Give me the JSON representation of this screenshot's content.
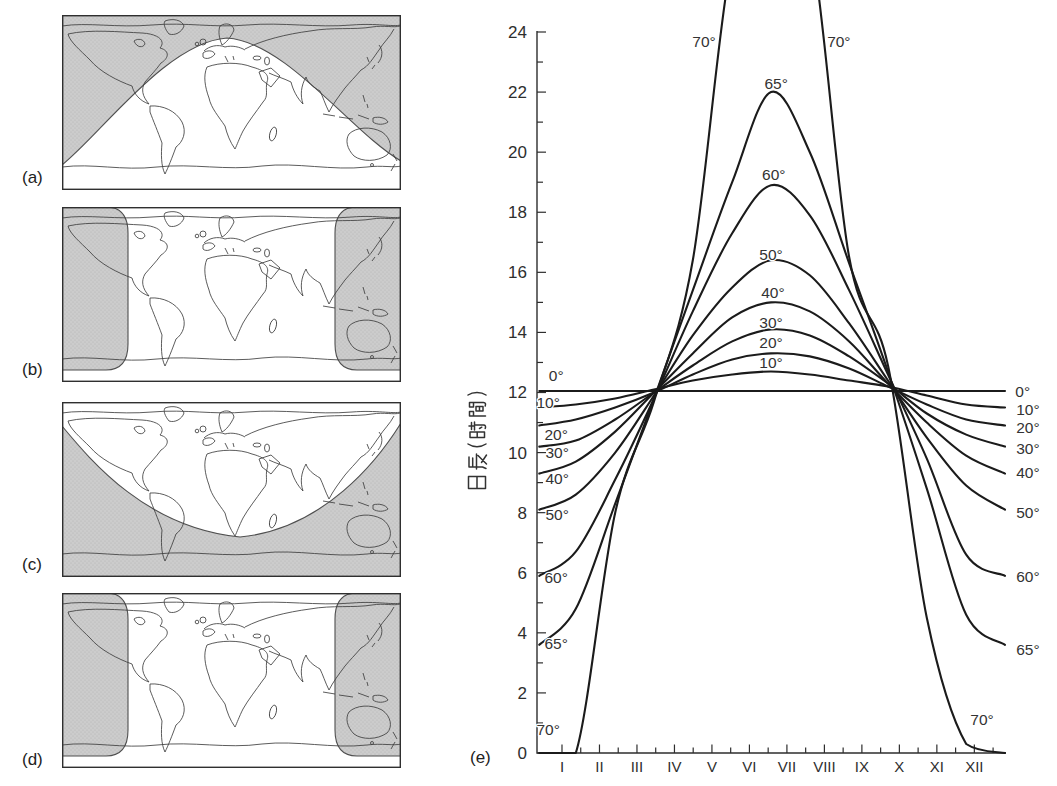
{
  "figure": {
    "panel_labels": {
      "a": "(a)",
      "b": "(b)",
      "c": "(c)",
      "d": "(d)",
      "e": "(e)"
    }
  },
  "chart_data": {
    "type": "line",
    "title": "",
    "xlabel": "",
    "ylabel": "日長（時間）",
    "ylim": [
      0,
      24
    ],
    "y_major_ticks": [
      0,
      2,
      4,
      6,
      8,
      10,
      12,
      14,
      16,
      18,
      20,
      22,
      24
    ],
    "y_minor_step": 1,
    "x_tick_labels": [
      "I",
      "II",
      "III",
      "IV",
      "V",
      "VI",
      "VII",
      "VIII",
      "IX",
      "X",
      "XI",
      "XII"
    ],
    "grid": false,
    "line_color": "#1b1b1b",
    "x_fracs": [
      0.005,
      0.083,
      0.167,
      0.25,
      0.333,
      0.417,
      0.5,
      0.583,
      0.667,
      0.75,
      0.833,
      0.917,
      1.0
    ],
    "series": [
      {
        "name": "0°",
        "latitude_deg": 0,
        "day_length_hours": [
          12.05,
          12.05,
          12.05,
          12.05,
          12.05,
          12.05,
          12.05,
          12.05,
          12.05,
          12.05,
          12.05,
          12.05,
          12.05
        ]
      },
      {
        "name": "10°",
        "latitude_deg": 10,
        "day_length_hours": [
          11.5,
          11.6,
          11.8,
          12.1,
          12.4,
          12.6,
          12.7,
          12.6,
          12.4,
          12.2,
          11.9,
          11.6,
          11.5
        ]
      },
      {
        "name": "20°",
        "latitude_deg": 20,
        "day_length_hours": [
          10.9,
          11.1,
          11.5,
          12.0,
          12.6,
          13.1,
          13.3,
          13.2,
          12.8,
          12.2,
          11.6,
          11.1,
          10.9
        ]
      },
      {
        "name": "30°",
        "latitude_deg": 30,
        "day_length_hours": [
          10.2,
          10.4,
          11.1,
          12.0,
          12.9,
          13.7,
          14.1,
          13.9,
          13.2,
          12.3,
          11.3,
          10.6,
          10.2
        ]
      },
      {
        "name": "40°",
        "latitude_deg": 40,
        "day_length_hours": [
          9.3,
          9.7,
          10.7,
          12.0,
          13.3,
          14.5,
          15.0,
          14.7,
          13.7,
          12.3,
          11.0,
          9.9,
          9.3
        ]
      },
      {
        "name": "50°",
        "latitude_deg": 50,
        "day_length_hours": [
          8.1,
          8.6,
          10.0,
          11.9,
          13.9,
          15.5,
          16.4,
          15.9,
          14.3,
          12.4,
          10.5,
          8.9,
          8.1
        ]
      },
      {
        "name": "60°",
        "latitude_deg": 60,
        "day_length_hours": [
          5.9,
          6.7,
          9.1,
          11.8,
          14.7,
          17.3,
          18.9,
          17.9,
          15.4,
          12.6,
          9.8,
          6.6,
          5.9
        ]
      },
      {
        "name": "65°",
        "latitude_deg": 65,
        "day_length_hours": [
          3.6,
          4.8,
          8.3,
          11.8,
          15.4,
          19.0,
          22.0,
          20.0,
          16.3,
          12.7,
          8.8,
          4.6,
          3.6
        ]
      },
      {
        "name": "70°",
        "latitude_deg": 70,
        "day_length_hours": [
          0,
          0,
          8.0,
          11.7,
          16.4,
          26.5,
          28.5,
          27.2,
          16.5,
          12.9,
          4.5,
          0.3,
          0
        ]
      }
    ],
    "curve_labels": {
      "left": [
        {
          "t": "0°",
          "x": 0.041,
          "y": 12.55
        },
        {
          "t": "10°",
          "x": 0.024,
          "y": 11.68
        },
        {
          "t": "20°",
          "x": 0.041,
          "y": 10.59
        },
        {
          "t": "30°",
          "x": 0.043,
          "y": 9.99
        },
        {
          "t": "40°",
          "x": 0.043,
          "y": 9.15
        },
        {
          "t": "50°",
          "x": 0.043,
          "y": 7.93
        },
        {
          "t": "60°",
          "x": 0.041,
          "y": 5.83
        },
        {
          "t": "65°",
          "x": 0.041,
          "y": 3.66
        },
        {
          "t": "70°",
          "x": 0.024,
          "y": 0.77
        }
      ],
      "peak": [
        {
          "t": "70°",
          "x": 0.357,
          "y": 23.7
        },
        {
          "t": "70°",
          "x": 0.645,
          "y": 23.7
        },
        {
          "t": "65°",
          "x": 0.511,
          "y": 22.3
        },
        {
          "t": "60°",
          "x": 0.506,
          "y": 19.25
        },
        {
          "t": "50°",
          "x": 0.5,
          "y": 16.6
        },
        {
          "t": "40°",
          "x": 0.504,
          "y": 15.32
        },
        {
          "t": "30°",
          "x": 0.5,
          "y": 14.32
        },
        {
          "t": "20°",
          "x": 0.5,
          "y": 13.66
        },
        {
          "t": "10°",
          "x": 0.5,
          "y": 12.99
        }
      ],
      "right": [
        {
          "t": "0°",
          "x": 1.038,
          "y": 12.02
        },
        {
          "t": "10°",
          "x": 1.049,
          "y": 11.45
        },
        {
          "t": "20°",
          "x": 1.049,
          "y": 10.85
        },
        {
          "t": "30°",
          "x": 1.049,
          "y": 10.12
        },
        {
          "t": "40°",
          "x": 1.049,
          "y": 9.35
        },
        {
          "t": "50°",
          "x": 1.049,
          "y": 8.02
        },
        {
          "t": "60°",
          "x": 1.049,
          "y": 5.86
        },
        {
          "t": "65°",
          "x": 1.049,
          "y": 3.43
        },
        {
          "t": "70°",
          "x": 0.951,
          "y": 1.1
        }
      ]
    }
  }
}
